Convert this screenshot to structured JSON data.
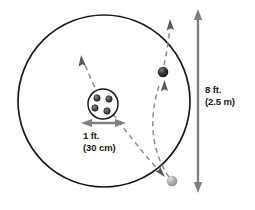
{
  "diagram": {
    "type": "orbital-scale-diagram",
    "title": "",
    "outer_circle": {
      "name": "outer-boundary-circle",
      "cx": 104,
      "cy": 101,
      "r": 86,
      "stroke": "#1a1a1a",
      "stroke_width": 1.6,
      "fill": "none"
    },
    "inner_circle": {
      "name": "central-body-circle",
      "cx": 103,
      "cy": 104,
      "r": 15,
      "stroke": "#1a1a1a",
      "stroke_width": 1.4,
      "fill": "#ffffff"
    },
    "inner_dots": [
      {
        "cx": 97,
        "cy": 98,
        "r": 3.1
      },
      {
        "cx": 109,
        "cy": 99,
        "r": 3.1
      },
      {
        "cx": 95,
        "cy": 108,
        "r": 3.1
      },
      {
        "cx": 107,
        "cy": 111,
        "r": 3.1
      }
    ],
    "inner_dot_fill": "#4d4d4d",
    "inner_dot_stroke": "#1a1a1a",
    "balls": [
      {
        "name": "dark-orbiting-ball",
        "cx": 163,
        "cy": 72,
        "r": 5.2,
        "fill": "#262626",
        "highlight": "#6b6b6b"
      },
      {
        "name": "light-orbiting-ball",
        "cx": 172,
        "cy": 181,
        "r": 5.2,
        "fill": "#a8a8a8",
        "highlight": "#d6d6d6"
      }
    ],
    "trajectories": [
      {
        "name": "inner-trajectory-path",
        "d": "M 112 113 C 126 132 142 152 160 172",
        "stroke": "#8c8c8c",
        "dash": "5 4"
      },
      {
        "name": "outer-trajectory-path",
        "d": "M 168 178 C 152 152 149 118 160 82",
        "stroke": "#8c8c8c",
        "dash": "5 4"
      },
      {
        "name": "upper-left-trajectory-path",
        "d": "M 97 96 C 93 86 88 74 84 62",
        "stroke": "#8c8c8c",
        "dash": "5 4"
      },
      {
        "name": "upper-right-trajectory-path",
        "d": "M 164 66 C 167 53 169 38 170 26",
        "stroke": "#8c8c8c",
        "dash": "5 4"
      }
    ],
    "arrowheads": [
      {
        "name": "upper-left-direction-arrowhead",
        "x": 82,
        "y": 57,
        "angle": -70
      },
      {
        "name": "upper-right-direction-arrowhead",
        "x": 170,
        "y": 21,
        "angle": -84
      },
      {
        "name": "ball-direction-arrowhead",
        "x": 164,
        "y": 83,
        "angle": -80
      },
      {
        "name": "lower-trajectory-arrowhead",
        "x": 162,
        "y": 174,
        "angle": 50
      }
    ],
    "dimension_lines": [
      {
        "name": "vertical-diameter-dimension",
        "orientation": "vertical",
        "x1": 198,
        "y1": 12,
        "x2": 198,
        "y2": 190,
        "stroke": "#7f7f7f",
        "stroke_width": 2.2
      },
      {
        "name": "horizontal-core-dimension",
        "orientation": "horizontal",
        "x1": 84,
        "y1": 123,
        "x2": 123,
        "y2": 123,
        "stroke": "#7f7f7f",
        "stroke_width": 2.2
      }
    ]
  },
  "labels": {
    "diameter": {
      "imperial": "8 ft.",
      "metric": "(2.5 m)"
    },
    "core": {
      "imperial": "1 ft.",
      "metric": "(30 cm)"
    }
  },
  "colors": {
    "stroke_dark": "#1a1a1a",
    "stroke_gray": "#7f7f7f",
    "dash_gray": "#8c8c8c",
    "ball_dark": "#262626",
    "ball_light": "#a8a8a8",
    "background": "#ffffff",
    "text": "#1a1a1a"
  }
}
